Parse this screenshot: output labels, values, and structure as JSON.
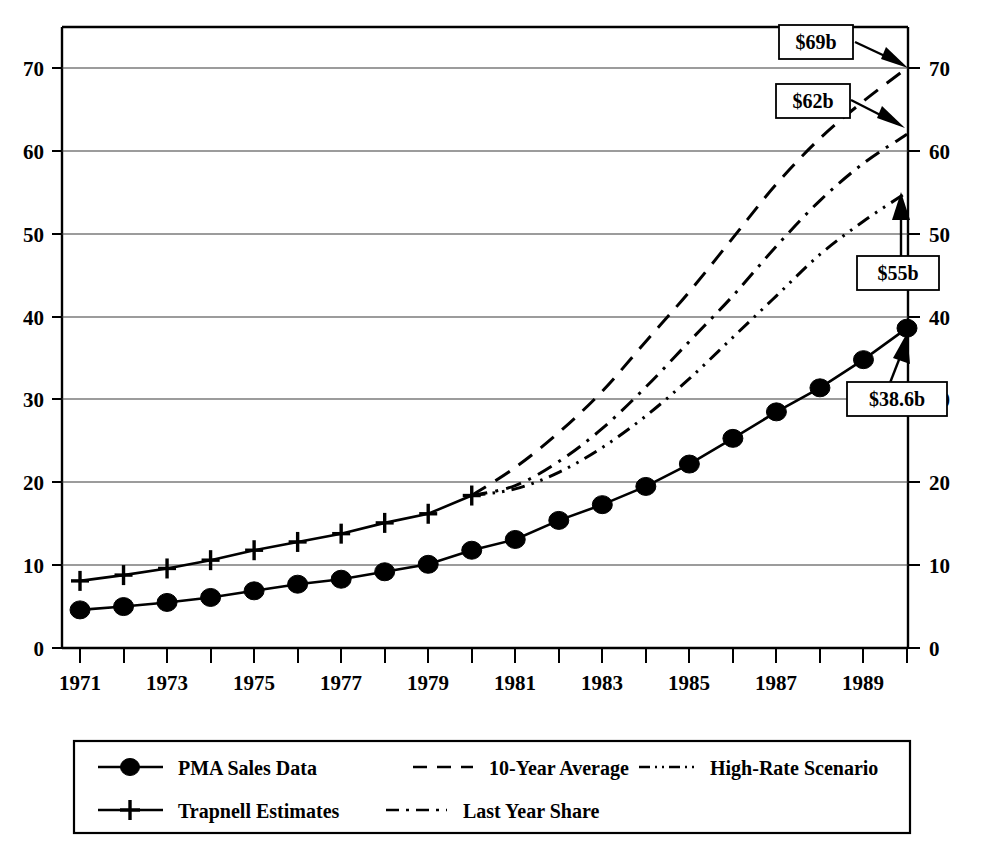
{
  "chart_data": {
    "type": "line",
    "title": "",
    "xlabel": "",
    "ylabel": "",
    "xlim": [
      1971,
      1990
    ],
    "ylim": [
      0,
      75
    ],
    "grid": true,
    "dual_y_axis": true,
    "y_ticks": [
      0,
      10,
      20,
      30,
      40,
      50,
      60,
      70
    ],
    "y_ticklabels": [
      "0",
      "10",
      "20",
      "30",
      "40",
      "50",
      "60",
      "70"
    ],
    "x_ticks": [
      1971,
      1972,
      1973,
      1974,
      1975,
      1976,
      1977,
      1978,
      1979,
      1980,
      1981,
      1982,
      1983,
      1984,
      1985,
      1986,
      1987,
      1988,
      1989,
      1990
    ],
    "x_ticklabels": [
      "1971",
      "",
      "1973",
      "",
      "1975",
      "",
      "1977",
      "",
      "1979",
      "",
      "1981",
      "",
      "1983",
      "",
      "1985",
      "",
      "1987",
      "",
      "1989",
      ""
    ],
    "legend_position": "below",
    "series": [
      {
        "name": "PMA Sales Data",
        "style": "solid",
        "marker": "filled-circle",
        "x": [
          1971,
          1972,
          1973,
          1974,
          1975,
          1976,
          1977,
          1978,
          1979,
          1980,
          1981,
          1982,
          1983,
          1984,
          1985,
          1986,
          1987,
          1988,
          1989,
          1990
        ],
        "values": [
          4.6,
          5.0,
          5.5,
          6.1,
          6.9,
          7.7,
          8.3,
          9.2,
          10.1,
          11.8,
          13.1,
          15.4,
          17.3,
          19.5,
          22.2,
          25.3,
          28.5,
          31.4,
          34.8,
          38.6
        ]
      },
      {
        "name": "Trapnell Estimates",
        "style": "solid",
        "marker": "cross",
        "x": [
          1971,
          1972,
          1973,
          1974,
          1975,
          1976,
          1977,
          1978,
          1979,
          1980
        ],
        "values": [
          8.1,
          8.8,
          9.6,
          10.6,
          11.8,
          12.8,
          13.8,
          15.1,
          16.2,
          18.4
        ]
      },
      {
        "name": "10-Year Average",
        "style": "dashed",
        "marker": "none",
        "x": [
          1980,
          1981,
          1982,
          1983,
          1984,
          1985,
          1986,
          1987,
          1988,
          1989,
          1990
        ],
        "values": [
          18.4,
          21.8,
          26.0,
          31.0,
          37.0,
          43.0,
          49.5,
          56.0,
          61.5,
          66.0,
          70.0
        ]
      },
      {
        "name": "Last Year Share",
        "style": "dash-dot",
        "marker": "none",
        "x": [
          1980,
          1981,
          1982,
          1983,
          1984,
          1985,
          1986,
          1987,
          1988,
          1989,
          1990
        ],
        "values": [
          18.4,
          19.6,
          22.5,
          26.5,
          31.5,
          37.0,
          42.5,
          48.5,
          54.0,
          58.5,
          62.0
        ]
      },
      {
        "name": "High-Rate Scenario",
        "style": "dash-dot-dot",
        "marker": "none",
        "x": [
          1980,
          1981,
          1982,
          1983,
          1984,
          1985,
          1986,
          1987,
          1988,
          1989,
          1990
        ],
        "values": [
          18.4,
          19.2,
          21.2,
          24.2,
          28.0,
          32.5,
          37.5,
          42.5,
          47.5,
          51.5,
          55.0
        ]
      }
    ],
    "annotations": [
      {
        "label": "$69b",
        "series": "10-Year Average",
        "value": 69,
        "arrow": "down-right"
      },
      {
        "label": "$62b",
        "series": "Last Year Share",
        "value": 62,
        "arrow": "down-right"
      },
      {
        "label": "$55b",
        "series": "High-Rate Scenario",
        "value": 55,
        "arrow": "up"
      },
      {
        "label": "$38.6b",
        "series": "PMA Sales Data",
        "value": 38.6,
        "arrow": "up-right"
      }
    ]
  },
  "axes": {
    "left_labels": [
      "70",
      "60",
      "50",
      "40",
      "30",
      "20",
      "10",
      "0"
    ],
    "right_labels": [
      "70",
      "60",
      "50",
      "40",
      "30",
      "20",
      "10",
      "0"
    ],
    "x_labels": [
      "1971",
      "1973",
      "1975",
      "1977",
      "1979",
      "1981",
      "1983",
      "1985",
      "1987",
      "1989"
    ]
  },
  "annotations": {
    "a1": "$69b",
    "a2": "$62b",
    "a3": "$55b",
    "a4": "$38.6b"
  },
  "legend": {
    "items": [
      {
        "label": "PMA Sales Data",
        "style": "solid-circle"
      },
      {
        "label": "10-Year Average",
        "style": "dashed"
      },
      {
        "label": "High-Rate Scenario",
        "style": "dash-dot-dot"
      },
      {
        "label": "Trapnell Estimates",
        "style": "solid-cross"
      },
      {
        "label": "Last Year Share",
        "style": "dash-dot"
      }
    ]
  },
  "colors": {
    "ink": "#000000",
    "grid": "#3a3a3a",
    "background": "#ffffff"
  }
}
